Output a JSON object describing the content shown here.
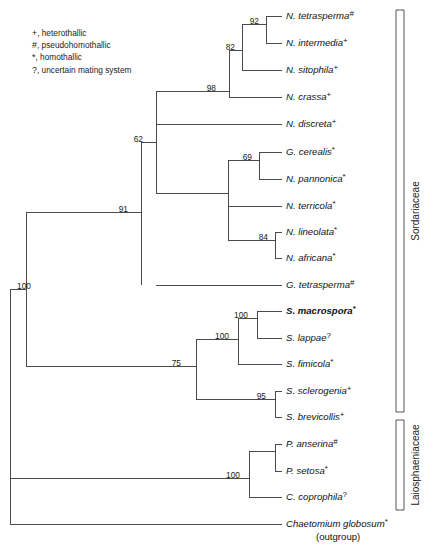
{
  "figure": {
    "width": 427,
    "height": 549,
    "line_color": "#4a4a4a",
    "text_color": "#111111"
  },
  "legend": {
    "items": [
      {
        "symbol": "+",
        "label": ", heterothallic"
      },
      {
        "symbol": "#",
        "label": ", pseudohomothallic"
      },
      {
        "symbol": "*",
        "label": ", homothallic"
      },
      {
        "symbol": "?",
        "label": ", uncertain mating system"
      }
    ]
  },
  "chart_data": {
    "type": "diagram",
    "subtype": "phylogenetic-cladogram",
    "orientation": "left-to-right",
    "branch_length_meaning": "topology only (cladogram)",
    "taxa": [
      {
        "id": "n_tetrasperma",
        "name": "N. tetrasperma",
        "mark": "#",
        "mating_system": "pseudohomothallic",
        "bold": false,
        "y": 16,
        "branch_x": 266
      },
      {
        "id": "n_intermedia",
        "name": "N. intermedia",
        "mark": "+",
        "mating_system": "heterothallic",
        "bold": false,
        "y": 43,
        "branch_x": 266
      },
      {
        "id": "n_sitophila",
        "name": "N. sitophila",
        "mark": "+",
        "mating_system": "heterothallic",
        "bold": false,
        "y": 70,
        "branch_x": 242
      },
      {
        "id": "n_crassa",
        "name": "N. crassa",
        "mark": "+",
        "mating_system": "heterothallic",
        "bold": false,
        "y": 97,
        "branch_x": 229
      },
      {
        "id": "n_discreta",
        "name": "N. discreta",
        "mark": "+",
        "mating_system": "heterothallic",
        "bold": false,
        "y": 124,
        "branch_x": 156
      },
      {
        "id": "g_cerealis",
        "name": "G. cerealis",
        "mark": "*",
        "mating_system": "homothallic",
        "bold": false,
        "y": 152,
        "branch_x": 259
      },
      {
        "id": "n_pannonica",
        "name": "N. pannonica",
        "mark": "*",
        "mating_system": "homothallic",
        "bold": false,
        "y": 179,
        "branch_x": 259
      },
      {
        "id": "n_terricola",
        "name": "N. terricola",
        "mark": "*",
        "mating_system": "homothallic",
        "bold": false,
        "y": 206,
        "branch_x": 228
      },
      {
        "id": "n_lineolata",
        "name": "N. lineolata",
        "mark": "*",
        "mating_system": "homothallic",
        "bold": false,
        "y": 232,
        "branch_x": 275
      },
      {
        "id": "n_africana",
        "name": "N. africana",
        "mark": "*",
        "mating_system": "homothallic",
        "bold": false,
        "y": 258,
        "branch_x": 275
      },
      {
        "id": "g_tetrasperma",
        "name": "G. tetrasperma",
        "mark": "#",
        "mating_system": "pseudohomothallic",
        "bold": false,
        "y": 285,
        "branch_x": 156
      },
      {
        "id": "s_macrospora",
        "name": "S. macrospora",
        "mark": "*",
        "mating_system": "homothallic",
        "bold": true,
        "y": 311,
        "branch_x": 257
      },
      {
        "id": "s_lappae",
        "name": "S. lappae",
        "mark": "?",
        "mating_system": "uncertain mating system",
        "bold": false,
        "y": 338,
        "branch_x": 257
      },
      {
        "id": "s_fimicola",
        "name": "S. fimicola",
        "mark": "*",
        "mating_system": "homothallic",
        "bold": false,
        "y": 364,
        "branch_x": 238
      },
      {
        "id": "s_sclerogenia",
        "name": "S. sclerogenia",
        "mark": "+",
        "mating_system": "heterothallic",
        "bold": false,
        "y": 391,
        "branch_x": 275
      },
      {
        "id": "s_brevicollis",
        "name": "S. brevicollis",
        "mark": "+",
        "mating_system": "heterothallic",
        "bold": false,
        "y": 417,
        "branch_x": 275
      },
      {
        "id": "p_anserina",
        "name": "P. anserina",
        "mark": "#",
        "mating_system": "pseudohomothallic",
        "bold": false,
        "y": 444,
        "branch_x": 275
      },
      {
        "id": "p_setosa",
        "name": "P. setosa",
        "mark": "*",
        "mating_system": "homothallic",
        "bold": false,
        "y": 471,
        "branch_x": 275
      },
      {
        "id": "c_coprophila",
        "name": "C. coprophila",
        "mark": "?",
        "mating_system": "uncertain mating system",
        "bold": false,
        "y": 497,
        "branch_x": 249
      },
      {
        "id": "chaetomium",
        "name": "Chaetomium globosum",
        "mark": "*",
        "mating_system": "homothallic",
        "bold": false,
        "y": 524,
        "branch_x": 10,
        "sublabel": "(outgroup)"
      }
    ],
    "tip_label_x": 286,
    "support_values": [
      {
        "value": "92",
        "x": 259,
        "y": 24,
        "node": "tetrasperma+intermedia"
      },
      {
        "value": "82",
        "x": 235,
        "y": 50,
        "node": "tetrasperma+intermedia+sitophila"
      },
      {
        "value": "98",
        "x": 216,
        "y": 91,
        "node": "neurospora-crassa-group"
      },
      {
        "value": "62",
        "x": 143,
        "y": 142,
        "node": "sordariaceae-core"
      },
      {
        "value": "69",
        "x": 252,
        "y": 160,
        "node": "cerealis+pannonica"
      },
      {
        "value": "91",
        "x": 128,
        "y": 212,
        "node": "sordariaceae"
      },
      {
        "value": "84",
        "x": 268,
        "y": 240,
        "node": "lineolata+africana"
      },
      {
        "value": "100",
        "x": 248,
        "y": 318,
        "node": "macrospora+lappae"
      },
      {
        "value": "100",
        "x": 229,
        "y": 339,
        "node": "macrospora+lappae+fimicola"
      },
      {
        "value": "75",
        "x": 181,
        "y": 366,
        "node": "sordaria-clade"
      },
      {
        "value": "95",
        "x": 266,
        "y": 399,
        "node": "sclerogenia+brevicollis"
      },
      {
        "value": "100",
        "x": 31,
        "y": 289,
        "node": "sordariaceae+laiosphaeniaceae"
      },
      {
        "value": "100",
        "x": 240,
        "y": 478,
        "node": "podospora-clade"
      }
    ],
    "families": [
      {
        "label": "Sordariaceae",
        "bracket_top": 10,
        "bracket_bottom": 412,
        "bracket_x": 396,
        "label_x": 419,
        "label_y": 211
      },
      {
        "label": "Laiosphaeniaceae",
        "bracket_top": 420,
        "bracket_bottom": 510,
        "bracket_x": 396,
        "label_x": 419,
        "label_y": 465
      }
    ],
    "internal_nodes": [
      {
        "id": "root",
        "x": 10,
        "children_y": [
          289,
          524
        ]
      },
      {
        "id": "node100_all",
        "x": 26,
        "children_y": [
          212,
          366
        ]
      },
      {
        "id": "node91",
        "x": 141,
        "children_y": [
          142,
          285
        ]
      },
      {
        "id": "node62",
        "x": 156,
        "children_y": [
          91,
          193
        ]
      },
      {
        "id": "node98",
        "x": 229,
        "children_y": [
          50,
          97,
          124
        ]
      },
      {
        "id": "node82",
        "x": 242,
        "children_y": [
          24,
          70
        ]
      },
      {
        "id": "node92",
        "x": 266,
        "children_y": [
          16,
          43
        ]
      },
      {
        "id": "gelas_node",
        "x": 228,
        "children_y": [
          160,
          240
        ]
      },
      {
        "id": "node69",
        "x": 259,
        "children_y": [
          152,
          179
        ]
      },
      {
        "id": "node84",
        "x": 275,
        "children_y": [
          232,
          258
        ]
      },
      {
        "id": "node75",
        "x": 196,
        "children_y": [
          339,
          399
        ]
      },
      {
        "id": "node100_sord",
        "x": 238,
        "children_y": [
          318,
          364
        ]
      },
      {
        "id": "node100_mac",
        "x": 257,
        "children_y": [
          311,
          338
        ]
      },
      {
        "id": "node95",
        "x": 275,
        "children_y": [
          391,
          417
        ]
      },
      {
        "id": "node100_pod",
        "x": 249,
        "children_y": [
          451,
          497
        ]
      },
      {
        "id": "node_pod2",
        "x": 275,
        "children_y": [
          444,
          471
        ]
      }
    ]
  }
}
